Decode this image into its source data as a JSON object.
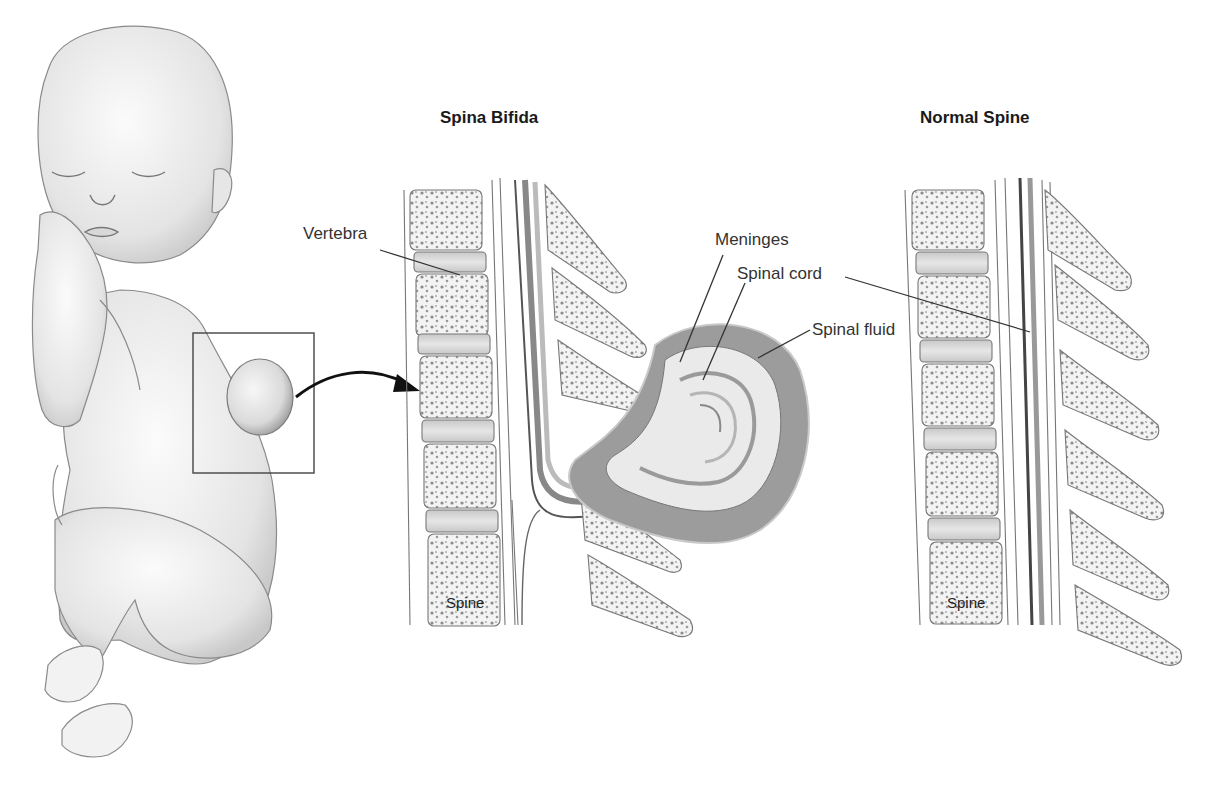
{
  "figure": {
    "panels": {
      "left": {
        "title": "Spina Bifida"
      },
      "right": {
        "title": "Normal Spine"
      }
    },
    "labels": {
      "vertebra": "Vertebra",
      "meninges": "Meninges",
      "spinal_cord": "Spinal cord",
      "spinal_fluid": "Spinal fluid",
      "spine_left": "Spine",
      "spine_right": "Spine"
    },
    "icons": {
      "arrow": "curved-arrow-icon",
      "highlight_box": "inset-box"
    },
    "colors": {
      "line": "#333333",
      "bone_fill": "#f2f2f2",
      "bone_dots": "#8a8a8a",
      "disc_fill": "#d6d6d6",
      "fluid_fill": "#9a9a9a",
      "cord_fill": "#e8e8e8",
      "skin": "#eeeeee"
    }
  }
}
